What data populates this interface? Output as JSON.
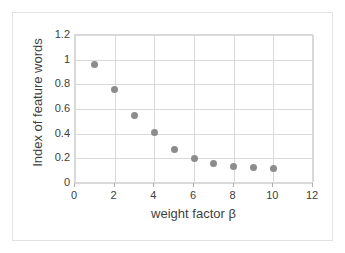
{
  "chart_data": {
    "type": "scatter",
    "title": "",
    "xlabel": "weight factor β",
    "ylabel": "Index of feature words",
    "xlim": [
      0,
      12
    ],
    "ylim": [
      0,
      1.2
    ],
    "grid": true,
    "legend": "none",
    "marker_color": "#8c8c8c",
    "gridline_color": "#d9d9d9",
    "x_tick_labels": [
      "0",
      "2",
      "4",
      "6",
      "8",
      "10",
      "12"
    ],
    "x_ticks": [
      0,
      2,
      4,
      6,
      8,
      10,
      12
    ],
    "y_tick_labels": [
      "0",
      "0.2",
      "0.4",
      "0.6",
      "0.8",
      "1",
      "1.2"
    ],
    "y_ticks": [
      0,
      0.2,
      0.4,
      0.6,
      0.8,
      1,
      1.2
    ],
    "x": [
      1,
      2,
      3,
      4,
      5,
      6,
      7,
      8,
      9,
      10
    ],
    "values": [
      0.96,
      0.76,
      0.55,
      0.41,
      0.275,
      0.2,
      0.155,
      0.135,
      0.125,
      0.115
    ],
    "series": [
      {
        "name": "Index of feature words",
        "points": [
          {
            "x": 1,
            "y": 0.96
          },
          {
            "x": 2,
            "y": 0.76
          },
          {
            "x": 3,
            "y": 0.55
          },
          {
            "x": 4,
            "y": 0.41
          },
          {
            "x": 5,
            "y": 0.275
          },
          {
            "x": 6,
            "y": 0.2
          },
          {
            "x": 7,
            "y": 0.155
          },
          {
            "x": 8,
            "y": 0.135
          },
          {
            "x": 9,
            "y": 0.125
          },
          {
            "x": 10,
            "y": 0.115
          }
        ]
      }
    ]
  }
}
